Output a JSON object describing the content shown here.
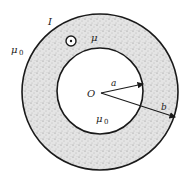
{
  "diagram": {
    "labels": {
      "current": "I",
      "medium": "μ",
      "outer_region": "μ",
      "outer_region_sub": "0",
      "inner_region": "μ",
      "inner_region_sub": "0",
      "center": "O",
      "inner_radius": "a",
      "outer_radius": "b"
    },
    "symbols": {
      "current_direction": "dot-in-circle (out of page)"
    },
    "colors": {
      "stroke": "#1a1a1a",
      "fill_medium": "#d9d9d9",
      "background": "#ffffff"
    },
    "geometry": {
      "center": [
        100,
        92
      ],
      "outer_radius_px": 78,
      "inner_radius_px": 43
    }
  }
}
